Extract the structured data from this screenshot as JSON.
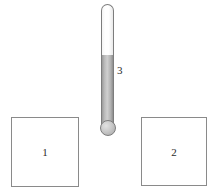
{
  "figure": {
    "background_color": "#ffffff",
    "outline_color": "#8a8a8a"
  },
  "squares": [
    {
      "label": "1",
      "name": "square-left",
      "position": "left"
    },
    {
      "label": "2",
      "name": "square-right",
      "position": "right"
    }
  ],
  "thermometer": {
    "label": "3",
    "fill_level_percent": 58,
    "stem_color": "#ffffff",
    "mercury_color": "#b9b9b9",
    "outline_color": "#7d7d7d",
    "bulb_color": "#c9c9c9"
  }
}
